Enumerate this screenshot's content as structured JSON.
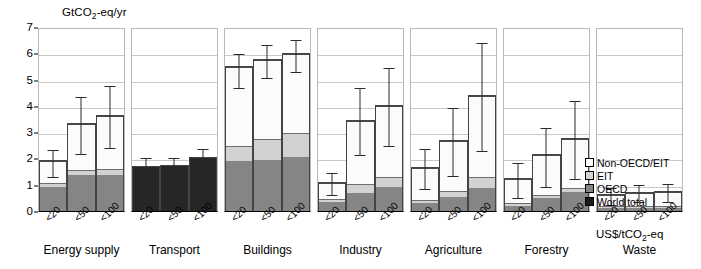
{
  "chart_data": {
    "type": "bar",
    "title": "",
    "ylabel": "GtCO2-eq/yr",
    "ylabel_rich": {
      "pre": "GtCO",
      "sub": "2",
      "post": "-eq/yr"
    },
    "xlabel": "US$/tCO2-eq",
    "xlabel_rich": {
      "pre": "US$/tCO",
      "sub": "2",
      "post": "-eq"
    },
    "ylim": [
      0,
      7
    ],
    "yticks": [
      0,
      1,
      2,
      3,
      4,
      5,
      6,
      7
    ],
    "grid": true,
    "legend_position": "right",
    "stacked": true,
    "categories": [
      "<20",
      "<50",
      "<100"
    ],
    "series_names": [
      "OECD",
      "EIT",
      "Non-OECD/EIT",
      "World total"
    ],
    "colors": {
      "non_oecd_eit": "#ffffff",
      "eit": "#d2d2d2",
      "oecd": "#858585",
      "world_total": "#1a1a1a",
      "grid": "#c9c9c9",
      "axis": "#000000"
    },
    "panels": [
      {
        "sector": "Energy supply",
        "bars": [
          {
            "category": "<20",
            "oecd": 0.92,
            "eit": 0.17,
            "non_oecd_eit": 0.85,
            "total": 1.94,
            "err_low": 1.36,
            "err_high": 2.39
          },
          {
            "category": "<50",
            "oecd": 1.37,
            "eit": 0.22,
            "non_oecd_eit": 1.74,
            "total": 3.33,
            "err_low": 2.26,
            "err_high": 4.41
          },
          {
            "category": "<100",
            "oecd": 1.38,
            "eit": 0.22,
            "non_oecd_eit": 2.07,
            "total": 3.67,
            "err_low": 2.48,
            "err_high": 4.85
          }
        ]
      },
      {
        "sector": "Transport",
        "bars": [
          {
            "category": "<20",
            "world_total": 1.72,
            "total": 1.72,
            "err_low": 1.32,
            "err_high": 2.08
          },
          {
            "category": "<50",
            "world_total": 1.76,
            "total": 1.76,
            "err_low": 1.35,
            "err_high": 2.08
          },
          {
            "category": "<100",
            "world_total": 2.07,
            "total": 2.07,
            "err_low": 1.56,
            "err_high": 2.45
          }
        ]
      },
      {
        "sector": "Buildings",
        "bars": [
          {
            "category": "<20",
            "oecd": 1.92,
            "eit": 0.58,
            "non_oecd_eit": 3.02,
            "total": 5.52,
            "err_low": 4.76,
            "err_high": 6.05
          },
          {
            "category": "<50",
            "oecd": 1.96,
            "eit": 0.79,
            "non_oecd_eit": 3.03,
            "total": 5.78,
            "err_low": 5.12,
            "err_high": 6.38
          },
          {
            "category": "<100",
            "oecd": 2.05,
            "eit": 0.95,
            "non_oecd_eit": 3.03,
            "total": 6.03,
            "err_low": 5.37,
            "err_high": 6.58
          }
        ]
      },
      {
        "sector": "Industry",
        "bars": [
          {
            "category": "<20",
            "oecd": 0.37,
            "eit": 0.1,
            "non_oecd_eit": 0.63,
            "total": 1.1,
            "err_low": 0.67,
            "err_high": 1.53
          },
          {
            "category": "<50",
            "oecd": 0.71,
            "eit": 0.33,
            "non_oecd_eit": 2.43,
            "total": 3.47,
            "err_low": 2.21,
            "err_high": 4.74
          },
          {
            "category": "<100",
            "oecd": 0.92,
            "eit": 0.38,
            "non_oecd_eit": 2.74,
            "total": 4.04,
            "err_low": 2.54,
            "err_high": 5.5
          }
        ]
      },
      {
        "sector": "Agriculture",
        "bars": [
          {
            "category": "<20",
            "oecd": 0.32,
            "eit": 0.12,
            "non_oecd_eit": 1.23,
            "total": 1.67,
            "err_low": 0.9,
            "err_high": 2.44
          },
          {
            "category": "<50",
            "oecd": 0.56,
            "eit": 0.21,
            "non_oecd_eit": 1.94,
            "total": 2.71,
            "err_low": 1.42,
            "err_high": 4.0
          },
          {
            "category": "<100",
            "oecd": 0.9,
            "eit": 0.41,
            "non_oecd_eit": 3.09,
            "total": 4.4,
            "err_low": 2.34,
            "err_high": 6.46
          }
        ]
      },
      {
        "sector": "Forestry",
        "bars": [
          {
            "category": "<20",
            "oecd": 0.21,
            "eit": 0.11,
            "non_oecd_eit": 0.93,
            "total": 1.25,
            "err_low": 0.58,
            "err_high": 1.92
          },
          {
            "category": "<50",
            "oecd": 0.49,
            "eit": 0.14,
            "non_oecd_eit": 1.54,
            "total": 2.17,
            "err_low": 1.0,
            "err_high": 3.25
          },
          {
            "category": "<100",
            "oecd": 0.74,
            "eit": 0.15,
            "non_oecd_eit": 1.9,
            "total": 2.79,
            "err_low": 1.29,
            "err_high": 4.25
          }
        ]
      },
      {
        "sector": "Waste",
        "bars": [
          {
            "category": "<20",
            "oecd": 0.11,
            "eit": 0.08,
            "non_oecd_eit": 0.44,
            "total": 0.63,
            "err_low": 0.32,
            "err_high": 0.94
          },
          {
            "category": "<50",
            "oecd": 0.12,
            "eit": 0.08,
            "non_oecd_eit": 0.53,
            "total": 0.73,
            "err_low": 0.42,
            "err_high": 1.05
          },
          {
            "category": "<100",
            "oecd": 0.13,
            "eit": 0.08,
            "non_oecd_eit": 0.56,
            "total": 0.77,
            "err_low": 0.43,
            "err_high": 1.1
          }
        ]
      }
    ],
    "legend": [
      {
        "label": "Non-OECD/EIT",
        "swatch": "non"
      },
      {
        "label": "EIT",
        "swatch": "eit"
      },
      {
        "label": "OECD",
        "swatch": "oecd"
      },
      {
        "label": "World total",
        "swatch": "world"
      }
    ]
  }
}
